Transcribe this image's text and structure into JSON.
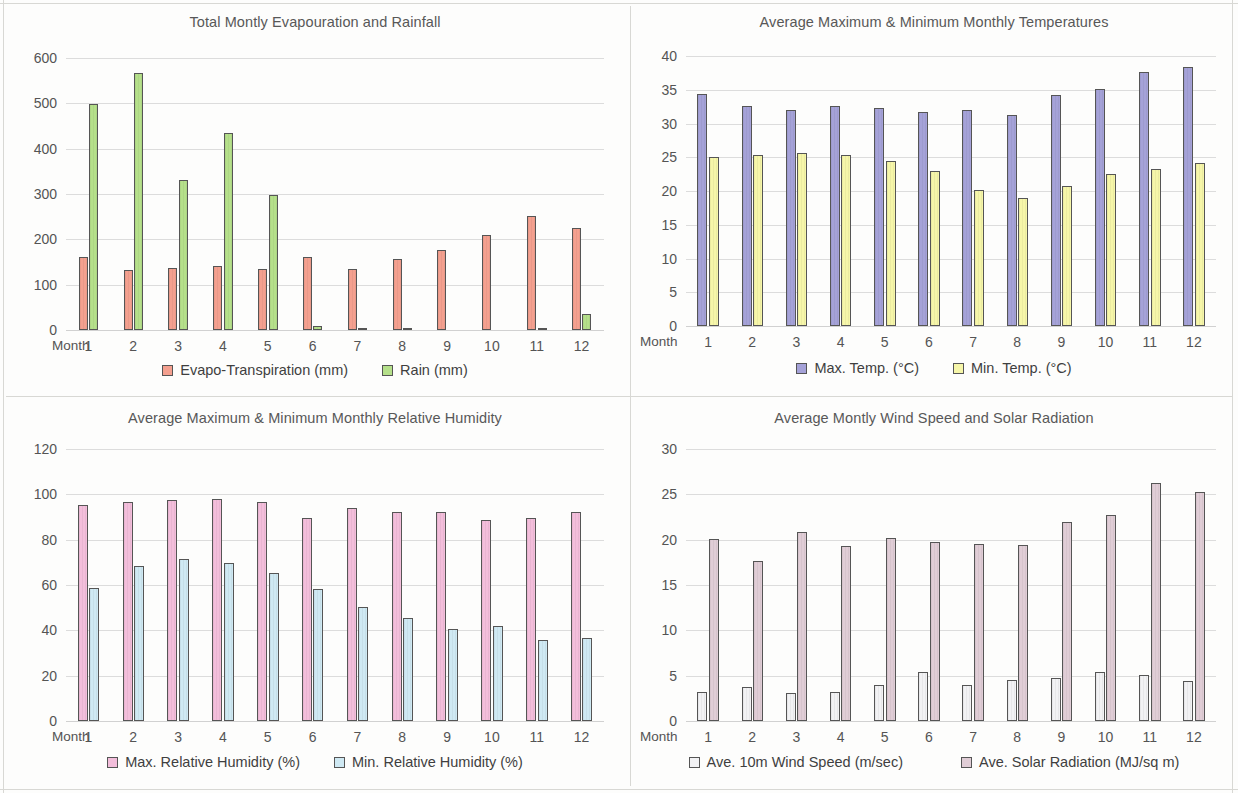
{
  "page": {
    "background": "#fdfdfc",
    "layout": "2x2 grid of bar charts"
  },
  "panels": [
    {
      "id": "evapouration-rainfall",
      "title": "Total Montly Evapouration and Rainfall",
      "x_axis_name": "Month",
      "y_ticks": [
        "0",
        "100",
        "200",
        "300",
        "400",
        "500",
        "600"
      ],
      "x_labels": [
        "1",
        "2",
        "3",
        "4",
        "5",
        "6",
        "7",
        "8",
        "9",
        "10",
        "11",
        "12"
      ],
      "legend": [
        {
          "label": "Evapo-Transpiration (mm)",
          "color": "#f4a08f"
        },
        {
          "label": "Rain (mm)",
          "color": "#b5e08a"
        }
      ]
    },
    {
      "id": "temperatures",
      "title": "Average Maximum & Minimum Monthly Temperatures",
      "x_axis_name": "Month",
      "y_ticks": [
        "0",
        "5",
        "10",
        "15",
        "20",
        "25",
        "30",
        "35",
        "40"
      ],
      "x_labels": [
        "1",
        "2",
        "3",
        "4",
        "5",
        "6",
        "7",
        "8",
        "9",
        "10",
        "11",
        "12"
      ],
      "legend": [
        {
          "label": "Max. Temp. (°C)",
          "color": "#a5a2d8"
        },
        {
          "label": "Min. Temp. (°C)",
          "color": "#f6f6a9"
        }
      ]
    },
    {
      "id": "relative-humidity",
      "title": "Average Maximum & Minimum Monthly Relative Humidity",
      "x_axis_name": "Month",
      "y_ticks": [
        "0",
        "20",
        "40",
        "60",
        "80",
        "100",
        "120"
      ],
      "x_labels": [
        "1",
        "2",
        "3",
        "4",
        "5",
        "6",
        "7",
        "8",
        "9",
        "10",
        "11",
        "12"
      ],
      "legend": [
        {
          "label": "Max. Relative Humidity (%)",
          "color": "#f3bedb"
        },
        {
          "label": "Min. Relative Humidity (%)",
          "color": "#cfe9f3"
        }
      ]
    },
    {
      "id": "wind-solar",
      "title": "Average Montly Wind Speed and Solar Radiation",
      "x_axis_name": "Month",
      "y_ticks": [
        "0",
        "5",
        "10",
        "15",
        "20",
        "25",
        "30"
      ],
      "x_labels": [
        "1",
        "2",
        "3",
        "4",
        "5",
        "6",
        "7",
        "8",
        "9",
        "10",
        "11",
        "12"
      ],
      "legend": [
        {
          "label": "Ave. 10m Wind Speed (m/sec)",
          "color": "#f2f2f4"
        },
        {
          "label": "Ave. Solar Radiation (MJ/sq m)",
          "color": "#e0cdd6"
        }
      ]
    }
  ],
  "chart_data": [
    {
      "type": "bar",
      "title": "Total Montly Evapouration and Rainfall",
      "xlabel": "Month",
      "ylabel": "",
      "categories": [
        "1",
        "2",
        "3",
        "4",
        "5",
        "6",
        "7",
        "8",
        "9",
        "10",
        "11",
        "12"
      ],
      "ylim": [
        0,
        600
      ],
      "yticks": [
        0,
        100,
        200,
        300,
        400,
        500,
        600
      ],
      "grid": true,
      "legend_position": "bottom",
      "series": [
        {
          "name": "Evapo-Transpiration (mm)",
          "color": "#f4a08f",
          "values": [
            160,
            133,
            137,
            141,
            135,
            162,
            134,
            157,
            176,
            209,
            252,
            226
          ]
        },
        {
          "name": "Rain (mm)",
          "color": "#b5e08a",
          "values": [
            498,
            568,
            330,
            435,
            297,
            9,
            5,
            5,
            0,
            0,
            5,
            35
          ]
        }
      ]
    },
    {
      "type": "bar",
      "title": "Average Maximum & Minimum Monthly Temperatures",
      "xlabel": "Month",
      "ylabel": "",
      "categories": [
        "1",
        "2",
        "3",
        "4",
        "5",
        "6",
        "7",
        "8",
        "9",
        "10",
        "11",
        "12"
      ],
      "ylim": [
        0,
        40
      ],
      "yticks": [
        0,
        5,
        10,
        15,
        20,
        25,
        30,
        35,
        40
      ],
      "grid": true,
      "legend_position": "bottom",
      "series": [
        {
          "name": "Max. Temp. (°C)",
          "color": "#a5a2d8",
          "values": [
            34.3,
            32.6,
            32.0,
            32.6,
            32.3,
            31.7,
            32.0,
            31.3,
            34.2,
            35.1,
            37.6,
            38.4
          ]
        },
        {
          "name": "Min. Temp. (°C)",
          "color": "#f6f6a9",
          "values": [
            25.0,
            25.3,
            25.6,
            25.3,
            24.4,
            23.0,
            20.2,
            18.9,
            20.7,
            22.5,
            23.2,
            24.2
          ]
        }
      ]
    },
    {
      "type": "bar",
      "title": "Average Maximum & Minimum Monthly Relative Humidity",
      "xlabel": "Month",
      "ylabel": "",
      "categories": [
        "1",
        "2",
        "3",
        "4",
        "5",
        "6",
        "7",
        "8",
        "9",
        "10",
        "11",
        "12"
      ],
      "ylim": [
        0,
        120
      ],
      "yticks": [
        0,
        20,
        40,
        60,
        80,
        100,
        120
      ],
      "grid": true,
      "legend_position": "bottom",
      "series": [
        {
          "name": "Max. Relative Humidity (%)",
          "color": "#f3bedb",
          "values": [
            95.4,
            96.7,
            97.3,
            98.1,
            96.5,
            89.6,
            94.0,
            92.0,
            92.3,
            88.6,
            89.6,
            92.4
          ]
        },
        {
          "name": "Min. Relative Humidity (%)",
          "color": "#cfe9f3",
          "values": [
            58.7,
            68.3,
            71.6,
            69.8,
            65.4,
            58.3,
            50.5,
            45.4,
            40.8,
            41.7,
            35.8,
            36.7
          ]
        }
      ]
    },
    {
      "type": "bar",
      "title": "Average Montly Wind Speed and Solar Radiation",
      "xlabel": "Month",
      "ylabel": "",
      "categories": [
        "1",
        "2",
        "3",
        "4",
        "5",
        "6",
        "7",
        "8",
        "9",
        "10",
        "11",
        "12"
      ],
      "ylim": [
        0,
        30
      ],
      "yticks": [
        0,
        5,
        10,
        15,
        20,
        25,
        30
      ],
      "grid": true,
      "legend_position": "bottom",
      "series": [
        {
          "name": "Ave. 10m Wind Speed (m/sec)",
          "color": "#f2f2f4",
          "values": [
            3.2,
            3.7,
            3.1,
            3.2,
            4.0,
            5.4,
            4.0,
            4.5,
            4.7,
            5.4,
            5.1,
            4.4
          ]
        },
        {
          "name": "Ave. Solar Radiation (MJ/sq m)",
          "color": "#e0cdd6",
          "values": [
            20.1,
            17.6,
            20.8,
            19.3,
            20.2,
            19.7,
            19.5,
            19.4,
            22.0,
            22.7,
            26.3,
            25.3
          ]
        }
      ]
    }
  ]
}
